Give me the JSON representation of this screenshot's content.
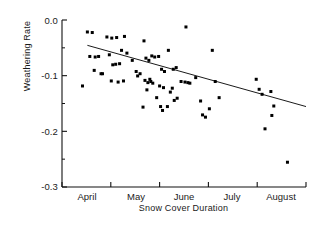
{
  "chart_data": {
    "type": "scatter",
    "title": "",
    "xlabel": "Snow Cover Duration",
    "ylabel": "Weathering Rate",
    "xlim": [
      0,
      5
    ],
    "ylim": [
      -0.3,
      0.0
    ],
    "grid": false,
    "legend": "none",
    "x_tick_labels": [
      "April",
      "May",
      "June",
      "July",
      "August"
    ],
    "x_tick_values": [
      0.5,
      1.5,
      2.5,
      3.5,
      4.5
    ],
    "x_axis_boundaries": [
      0,
      1,
      2,
      3,
      4,
      5
    ],
    "y_tick_labels": [
      "0.0",
      "-0.1",
      "-0.2",
      "-0.3"
    ],
    "y_tick_values": [
      0.0,
      -0.1,
      -0.2,
      -0.3
    ],
    "y_minor_tick_values": [
      -0.05,
      -0.15,
      -0.25
    ],
    "marker": "square",
    "marker_color": "#000000",
    "marker_size_px": 3,
    "line_color": "#000000",
    "trend_line": {
      "label": "least-squares fit",
      "x_start": 0.52,
      "y_start": -0.0455,
      "x_end": 5.0,
      "y_end": -0.1555
    },
    "points": [
      {
        "x": 0.52,
        "y": -0.0215
      },
      {
        "x": 0.62,
        "y": -0.0225
      },
      {
        "x": 0.57,
        "y": -0.0655
      },
      {
        "x": 0.68,
        "y": -0.0665
      },
      {
        "x": 0.75,
        "y": -0.0655
      },
      {
        "x": 0.66,
        "y": -0.0905
      },
      {
        "x": 0.8,
        "y": -0.0965
      },
      {
        "x": 0.83,
        "y": -0.0965
      },
      {
        "x": 0.42,
        "y": -0.1185
      },
      {
        "x": 0.92,
        "y": -0.0305
      },
      {
        "x": 1.02,
        "y": -0.0325
      },
      {
        "x": 1.12,
        "y": -0.0315
      },
      {
        "x": 1.28,
        "y": -0.0295
      },
      {
        "x": 0.97,
        "y": -0.0625
      },
      {
        "x": 1.22,
        "y": -0.0545
      },
      {
        "x": 1.33,
        "y": -0.0595
      },
      {
        "x": 1.04,
        "y": -0.0805
      },
      {
        "x": 1.1,
        "y": -0.0795
      },
      {
        "x": 1.18,
        "y": -0.0785
      },
      {
        "x": 1.01,
        "y": -0.1095
      },
      {
        "x": 1.15,
        "y": -0.1115
      },
      {
        "x": 1.26,
        "y": -0.1095
      },
      {
        "x": 1.44,
        "y": -0.0725
      },
      {
        "x": 1.52,
        "y": -0.0925
      },
      {
        "x": 1.6,
        "y": -0.0965
      },
      {
        "x": 1.55,
        "y": -0.1005
      },
      {
        "x": 1.68,
        "y": -0.0375
      },
      {
        "x": 1.72,
        "y": -0.0685
      },
      {
        "x": 1.78,
        "y": -0.0725
      },
      {
        "x": 1.84,
        "y": -0.0645
      },
      {
        "x": 1.7,
        "y": -0.1085
      },
      {
        "x": 1.76,
        "y": -0.1125
      },
      {
        "x": 1.8,
        "y": -0.1065
      },
      {
        "x": 1.82,
        "y": -0.1105
      },
      {
        "x": 1.86,
        "y": -0.1135
      },
      {
        "x": 1.74,
        "y": -0.1255
      },
      {
        "x": 1.66,
        "y": -0.1565
      },
      {
        "x": 1.9,
        "y": -0.0665
      },
      {
        "x": 1.98,
        "y": -0.0655
      },
      {
        "x": 2.04,
        "y": -0.0885
      },
      {
        "x": 2.1,
        "y": -0.0925
      },
      {
        "x": 2.0,
        "y": -0.1185
      },
      {
        "x": 2.08,
        "y": -0.1215
      },
      {
        "x": 1.94,
        "y": -0.1395
      },
      {
        "x": 2.02,
        "y": -0.1555
      },
      {
        "x": 2.06,
        "y": -0.1625
      },
      {
        "x": 2.16,
        "y": -0.1555
      },
      {
        "x": 2.22,
        "y": -0.1295
      },
      {
        "x": 2.26,
        "y": -0.1225
      },
      {
        "x": 2.3,
        "y": -0.1445
      },
      {
        "x": 2.36,
        "y": -0.1405
      },
      {
        "x": 2.18,
        "y": -0.0545
      },
      {
        "x": 2.28,
        "y": -0.0885
      },
      {
        "x": 2.34,
        "y": -0.0855
      },
      {
        "x": 2.44,
        "y": -0.1105
      },
      {
        "x": 2.52,
        "y": -0.1115
      },
      {
        "x": 2.58,
        "y": -0.1125
      },
      {
        "x": 2.62,
        "y": -0.1135
      },
      {
        "x": 2.54,
        "y": -0.0125
      },
      {
        "x": 2.74,
        "y": -0.1035
      },
      {
        "x": 2.84,
        "y": -0.1455
      },
      {
        "x": 2.88,
        "y": -0.1705
      },
      {
        "x": 2.94,
        "y": -0.1745
      },
      {
        "x": 3.02,
        "y": -0.1595
      },
      {
        "x": 3.08,
        "y": -0.0545
      },
      {
        "x": 3.14,
        "y": -0.1105
      },
      {
        "x": 3.22,
        "y": -0.1395
      },
      {
        "x": 3.98,
        "y": -0.1065
      },
      {
        "x": 4.04,
        "y": -0.1245
      },
      {
        "x": 4.1,
        "y": -0.1335
      },
      {
        "x": 4.16,
        "y": -0.1955
      },
      {
        "x": 4.28,
        "y": -0.1285
      },
      {
        "x": 4.34,
        "y": -0.1545
      },
      {
        "x": 4.3,
        "y": -0.1715
      },
      {
        "x": 4.62,
        "y": -0.2555
      }
    ]
  }
}
